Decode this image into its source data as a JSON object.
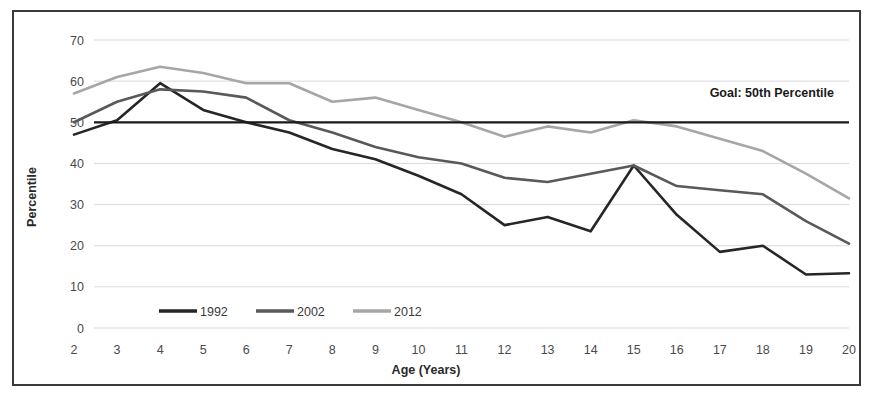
{
  "chart_data": {
    "type": "line",
    "title": "",
    "xlabel": "Age (Years)",
    "ylabel": "Percentile",
    "xlim": [
      2,
      20
    ],
    "ylim": [
      0,
      70
    ],
    "grid": true,
    "legend_position": "bottom-left",
    "x": [
      2,
      3,
      4,
      5,
      6,
      7,
      8,
      9,
      10,
      11,
      12,
      13,
      14,
      15,
      16,
      17,
      18,
      19,
      20
    ],
    "xtick_labels": [
      "2",
      "3",
      "4",
      "5",
      "6",
      "7",
      "8",
      "9",
      "10",
      "11",
      "12",
      "13",
      "14",
      "15",
      "16",
      "17",
      "18",
      "19",
      "20"
    ],
    "ytick_labels": [
      "0",
      "10",
      "20",
      "30",
      "40",
      "50",
      "60",
      "70"
    ],
    "ytick_values": [
      0,
      10,
      20,
      30,
      40,
      50,
      60,
      70
    ],
    "series": [
      {
        "name": "1992",
        "color": "#262626",
        "values": [
          47.0,
          50.5,
          59.5,
          53.0,
          50.0,
          47.5,
          43.5,
          41.0,
          37.0,
          32.5,
          25.0,
          27.0,
          23.5,
          39.5,
          27.5,
          18.5,
          20.0,
          13.0,
          13.3
        ]
      },
      {
        "name": "2002",
        "color": "#595959",
        "values": [
          50.0,
          55.0,
          58.0,
          57.5,
          56.0,
          50.5,
          47.5,
          44.0,
          41.5,
          40.0,
          36.5,
          35.5,
          37.5,
          39.5,
          34.5,
          33.5,
          32.5,
          26.0,
          20.5
        ]
      },
      {
        "name": "2012",
        "color": "#a6a6a6",
        "values": [
          57.0,
          61.0,
          63.5,
          62.0,
          59.5,
          59.5,
          55.0,
          56.0,
          53.0,
          50.0,
          46.5,
          49.0,
          47.5,
          50.5,
          49.0,
          46.0,
          43.0,
          37.5,
          31.5
        ]
      }
    ],
    "reference_line": {
      "label": "Goal: 50th Percentile",
      "value": 50,
      "color": "#1a1a1a"
    }
  },
  "figure": {
    "border_color": "#3a3a3a",
    "background": "#ffffff",
    "gridline_color": "#d9d9d9"
  }
}
